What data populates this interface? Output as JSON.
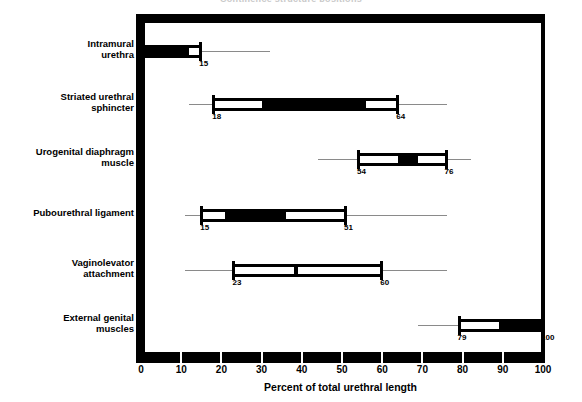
{
  "chart_data": {
    "type": "bar",
    "title": "Continence structure positions",
    "xlabel": "Percent of total urethral length",
    "ylabel": "",
    "xlim": [
      0,
      100
    ],
    "grid": false,
    "legend": "none",
    "orientation": "horizontal",
    "xticks": [
      0,
      10,
      20,
      30,
      40,
      50,
      60,
      70,
      80,
      90,
      100
    ],
    "xticklabels": [
      "0",
      "10",
      "20",
      "30",
      "40",
      "50",
      "60",
      "70",
      "80",
      "90",
      "100"
    ],
    "categories": [
      "Intramural\nurethra",
      "Striated urethral\nsphincter",
      "Urogenital diaphragm\nmuscle",
      "Pubourethral ligament",
      "Vaginolevator\nattachment",
      "External genital\nmuscles"
    ],
    "series": [
      {
        "name": "extent",
        "bars": [
          {
            "category": "Intramural urethra",
            "start": 0,
            "end": 15,
            "start_label": "0",
            "end_label": "15",
            "whisker_low": 0,
            "whisker_high": 32,
            "fill_start": 0,
            "fill_end": 12
          },
          {
            "category": "Striated urethral sphincter",
            "start": 18,
            "end": 64,
            "start_label": "18",
            "end_label": "64",
            "whisker_low": 12,
            "whisker_high": 76,
            "fill_start": 30,
            "fill_end": 56
          },
          {
            "category": "Urogenital diaphragm muscle",
            "start": 54,
            "end": 76,
            "start_label": "54",
            "end_label": "76",
            "whisker_low": 44,
            "whisker_high": 82,
            "fill_start": 64,
            "fill_end": 69
          },
          {
            "category": "Pubourethral ligament",
            "start": 15,
            "end": 51,
            "start_label": "15",
            "end_label": "51",
            "whisker_low": 11,
            "whisker_high": 76,
            "fill_start": 21,
            "fill_end": 36
          },
          {
            "category": "Vaginolevator attachment",
            "start": 23,
            "end": 60,
            "start_label": "23",
            "end_label": "60",
            "whisker_low": 11,
            "whisker_high": 76,
            "fill_start": 38,
            "fill_end": 39
          },
          {
            "category": "External genital muscles",
            "start": 79,
            "end": 100,
            "start_label": "79",
            "end_label": "100",
            "whisker_low": 69,
            "whisker_high": 100,
            "fill_start": 89,
            "fill_end": 100
          }
        ]
      }
    ]
  }
}
